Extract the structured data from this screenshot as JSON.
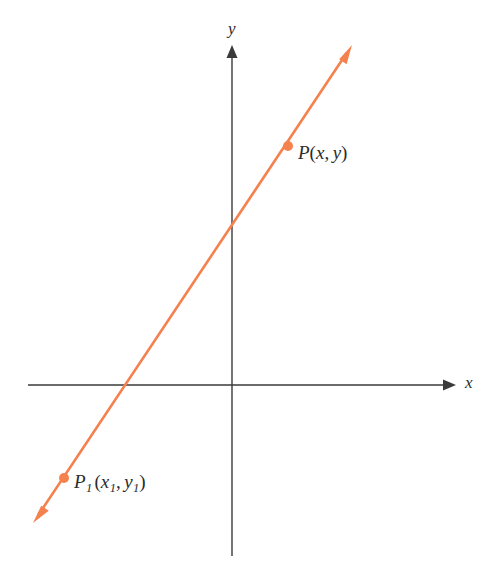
{
  "figure": {
    "background_color": "#ffffff",
    "axis_color": "#3a3a3a",
    "line_color": "#F4814E",
    "point_color": "#F4814E",
    "label_color": "#2b2b2b"
  },
  "axes": {
    "x_axis": {
      "label": "x",
      "label_position": {
        "x": 465,
        "y": 374
      },
      "start": {
        "x": 28,
        "y": 385
      },
      "end": {
        "x": 456,
        "y": 385
      },
      "arrow": "right"
    },
    "y_axis": {
      "label": "y",
      "label_position": {
        "x": 228,
        "y": 20
      },
      "start": {
        "x": 232,
        "y": 556
      },
      "end": {
        "x": 232,
        "y": 45
      },
      "arrow": "up"
    },
    "origin": {
      "x": 232,
      "y": 385
    }
  },
  "line": {
    "from": {
      "x": 33,
      "y": 523
    },
    "to": {
      "x": 352,
      "y": 45
    },
    "arrow_start": true,
    "arrow_end": true,
    "stroke_width": 2.6,
    "x_intercept_px": {
      "x": 128,
      "y": 385
    },
    "y_intercept_px": {
      "x": 232,
      "y": 232
    }
  },
  "points": [
    {
      "id": "P1",
      "name_main": "P",
      "name_sub": "1",
      "coord_x_main": "x",
      "coord_x_sub": "1",
      "coord_y_main": "y",
      "coord_y_sub": "1",
      "open_paren": "(",
      "close_paren": ")",
      "comma": ",",
      "dot": {
        "x": 64,
        "y": 478
      },
      "label_position": {
        "x": 74,
        "y": 472
      },
      "dot_radius": 5
    },
    {
      "id": "P",
      "name_main": "P",
      "name_sub": "",
      "coord_x_main": "x",
      "coord_x_sub": "",
      "coord_y_main": "y",
      "coord_y_sub": "",
      "open_paren": "(",
      "close_paren": ")",
      "comma": ",",
      "dot": {
        "x": 288,
        "y": 146
      },
      "label_position": {
        "x": 298,
        "y": 143
      },
      "dot_radius": 5
    }
  ],
  "chart_data": {
    "type": "line",
    "title": "",
    "xlabel": "x",
    "ylabel": "y",
    "grid": false,
    "legend": null,
    "axis_arrows": {
      "x": "right",
      "y": "up"
    },
    "series": [
      {
        "name": "line through P1 and P",
        "style": "double-headed arrow",
        "color": "#F4814E",
        "points_px": [
          [
            33,
            523
          ],
          [
            352,
            45
          ]
        ]
      }
    ],
    "annotations": [
      {
        "text": "P_1(x_1, y_1)",
        "at_px": [
          64,
          478
        ],
        "marker": "filled-dot"
      },
      {
        "text": "P(x, y)",
        "at_px": [
          288,
          146
        ],
        "marker": "filled-dot"
      },
      {
        "text": "x",
        "at_px": [
          465,
          382
        ],
        "marker": "axis-label"
      },
      {
        "text": "y",
        "at_px": [
          232,
          30
        ],
        "marker": "axis-label"
      }
    ]
  }
}
